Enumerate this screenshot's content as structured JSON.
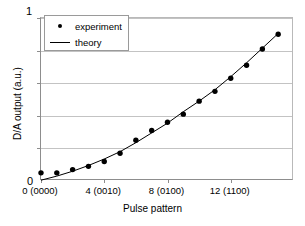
{
  "chart_data": {
    "type": "scatter",
    "title": "",
    "xlabel": "Pulse pattern",
    "ylabel": "D/A output (a.u.)",
    "xlim": [
      0,
      16
    ],
    "ylim": [
      0,
      1
    ],
    "grid": true,
    "legend_position": "top-left",
    "y_tick_labels": [
      "0",
      "1"
    ],
    "y_gridline_values": [
      0.2,
      0.4,
      0.6,
      0.8,
      1.0
    ],
    "x_tick_labels": [
      "0 (0000)",
      "4 (0010)",
      "8 (0100)",
      "12 (1100)"
    ],
    "x_tick_values": [
      0,
      4,
      8,
      12
    ],
    "x": [
      0,
      1,
      2,
      3,
      4,
      5,
      6,
      7,
      8,
      9,
      10,
      11,
      12,
      13,
      14,
      15
    ],
    "series": [
      {
        "name": "experiment",
        "marker": "dot",
        "color": "#000000",
        "values": [
          0.05,
          0.05,
          0.07,
          0.09,
          0.12,
          0.17,
          0.25,
          0.31,
          0.36,
          0.41,
          0.49,
          0.55,
          0.63,
          0.71,
          0.81,
          0.9
        ]
      },
      {
        "name": "theory",
        "marker": "line",
        "color": "#000000",
        "values": [
          0.005,
          0.03,
          0.06,
          0.095,
          0.135,
          0.18,
          0.235,
          0.295,
          0.355,
          0.425,
          0.49,
          0.56,
          0.64,
          0.725,
          0.815,
          0.905
        ]
      }
    ]
  },
  "legend": {
    "items": [
      {
        "label": "experiment",
        "key": "dot-marker"
      },
      {
        "label": "theory",
        "key": "line-marker"
      }
    ]
  },
  "axes": {
    "y_max": "1",
    "y_min": "0",
    "y_title": "D/A output (a.u.)",
    "x_title": "Pulse pattern"
  }
}
